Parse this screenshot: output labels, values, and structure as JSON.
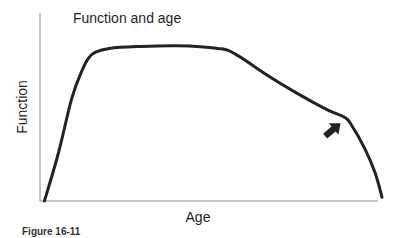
{
  "chart_data": {
    "type": "line",
    "title": "Function and age",
    "xlabel": "Age",
    "ylabel": "Function",
    "caption": "Figure 16-11",
    "xlim": [
      0,
      100
    ],
    "ylim": [
      0,
      100
    ],
    "grid": false,
    "legend": "none",
    "tick_labels": {
      "x": [],
      "y": []
    },
    "series": [
      {
        "name": "Function",
        "points": [
          [
            1,
            0
          ],
          [
            5,
            25
          ],
          [
            9,
            55
          ],
          [
            12,
            70
          ],
          [
            14,
            77
          ],
          [
            16,
            80
          ],
          [
            20,
            82
          ],
          [
            28,
            83
          ],
          [
            40,
            83.5
          ],
          [
            52,
            82
          ],
          [
            57,
            79
          ],
          [
            66,
            68
          ],
          [
            75,
            58
          ],
          [
            84,
            49
          ],
          [
            89,
            45
          ],
          [
            91,
            41
          ],
          [
            95,
            28
          ],
          [
            98,
            15
          ],
          [
            100,
            2
          ]
        ]
      }
    ],
    "annotations": [
      {
        "type": "arrow",
        "points_to": [
          89,
          45
        ],
        "direction": "up-right",
        "meaning": "knee where decline accelerates"
      }
    ]
  },
  "colors": {
    "curve": "#222222",
    "axis": "#8a8a8a",
    "text": "#1e1e1e"
  }
}
